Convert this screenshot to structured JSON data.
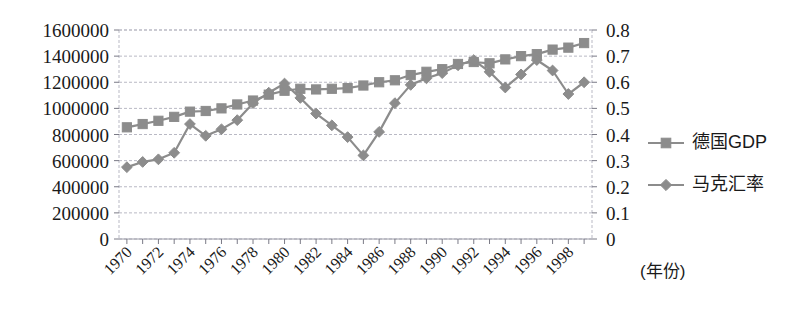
{
  "chart_data": {
    "type": "line",
    "title": "",
    "subtitle": "",
    "xlabel": "(年份)",
    "ylabel": "",
    "grid": true,
    "legend_position": "right",
    "x": [
      1970,
      1971,
      1972,
      1973,
      1974,
      1975,
      1976,
      1977,
      1978,
      1979,
      1980,
      1981,
      1982,
      1983,
      1984,
      1985,
      1986,
      1987,
      1988,
      1989,
      1990,
      1991,
      1992,
      1993,
      1994,
      1995,
      1996,
      1997,
      1998,
      1999
    ],
    "xtick_labels": [
      "1970",
      "1972",
      "1974",
      "1976",
      "1978",
      "1980",
      "1982",
      "1984",
      "1986",
      "1988",
      "1990",
      "1992",
      "1994",
      "1996",
      "1998"
    ],
    "axes": [
      {
        "side": "left",
        "name": "德国GDP",
        "ylim": [
          0,
          1600000
        ],
        "ytick_labels": [
          "0",
          "200000",
          "400000",
          "600000",
          "800000",
          "1000000",
          "1200000",
          "1400000",
          "1600000"
        ],
        "ytick_values": [
          0,
          200000,
          400000,
          600000,
          800000,
          1000000,
          1200000,
          1400000,
          1600000
        ]
      },
      {
        "side": "right",
        "name": "马克汇率",
        "ylim": [
          0,
          0.8
        ],
        "ytick_labels": [
          "0",
          "0.1",
          "0.2",
          "0.3",
          "0.4",
          "0.5",
          "0.6",
          "0.7",
          "0.8"
        ],
        "ytick_values": [
          0,
          0.1,
          0.2,
          0.3,
          0.4,
          0.5,
          0.6,
          0.7,
          0.8
        ]
      }
    ],
    "series": [
      {
        "name": "德国GDP",
        "axis": "left",
        "color": "#8c8c8c",
        "marker": "square",
        "values": [
          855000,
          880000,
          905000,
          935000,
          975000,
          980000,
          1000000,
          1030000,
          1060000,
          1105000,
          1135000,
          1150000,
          1145000,
          1150000,
          1155000,
          1175000,
          1200000,
          1215000,
          1255000,
          1280000,
          1300000,
          1340000,
          1355000,
          1345000,
          1375000,
          1400000,
          1415000,
          1450000,
          1465000,
          1500000
        ]
      },
      {
        "name": "马克汇率",
        "axis": "right",
        "color": "#8c8c8c",
        "marker": "diamond",
        "values": [
          0.275,
          0.295,
          0.305,
          0.33,
          0.44,
          0.395,
          0.42,
          0.455,
          0.52,
          0.56,
          0.595,
          0.54,
          0.48,
          0.435,
          0.39,
          0.32,
          0.41,
          0.52,
          0.59,
          0.615,
          0.635,
          0.665,
          0.685,
          0.64,
          0.58,
          0.63,
          0.685,
          0.645,
          0.555,
          0.6
        ]
      }
    ]
  },
  "legend": {
    "items": [
      {
        "label": "德国GDP",
        "marker": "square",
        "color": "#8c8c8c"
      },
      {
        "label": "马克汇率",
        "marker": "diamond",
        "color": "#8c8c8c"
      }
    ]
  },
  "axis_note": "(年份)",
  "colors": {
    "series": "#8c8c8c",
    "grid": "#b9b9c4",
    "frame": "#b9b9c4",
    "text": "#1a1a1a",
    "background": "#ffffff"
  }
}
